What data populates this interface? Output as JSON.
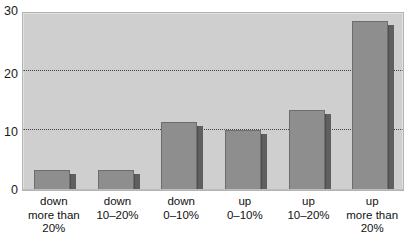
{
  "chart_data": {
    "type": "bar",
    "title": "",
    "subtitle": "",
    "xlabel": "",
    "ylabel": "",
    "categories": [
      "down more than 20%",
      "down 10–20%",
      "down 0–10%",
      "up 0–10%",
      "up 10–20%",
      "up more than 20%"
    ],
    "category_lines": [
      [
        "down",
        "more than",
        "20%"
      ],
      [
        "down",
        "10–20%"
      ],
      [
        "down",
        "0–10%"
      ],
      [
        "up",
        "0–10%"
      ],
      [
        "up",
        "10–20%"
      ],
      [
        "up",
        "more than",
        "20%"
      ]
    ],
    "values": [
      3.3,
      3.3,
      11.4,
      10.1,
      13.4,
      28.4
    ],
    "ylim": [
      0,
      30
    ],
    "ytick_labels": [
      "0",
      "10",
      "20",
      "30"
    ],
    "ytick_values": [
      0,
      10,
      20,
      30
    ],
    "gridlines_at": [
      10,
      20
    ],
    "grid": true,
    "grid_style": "dotted",
    "legend": "none",
    "legend_position": "none",
    "style": "3d-bar",
    "colors": {
      "bar_front": "#8e8e8e",
      "bar_side": "#5f5f5f",
      "bar_outline": "#6d6d6d",
      "plot_background": "#cfcfcf",
      "plot_border": "#b4b4b4",
      "gridline": "#2c2c2c",
      "text": "#111111",
      "page_background": "#ffffff"
    }
  },
  "axis": {
    "y_ticks": [
      {
        "label": "30",
        "value": 30
      },
      {
        "label": "20",
        "value": 20
      },
      {
        "label": "10",
        "value": 10
      },
      {
        "label": "0",
        "value": 0
      }
    ]
  }
}
